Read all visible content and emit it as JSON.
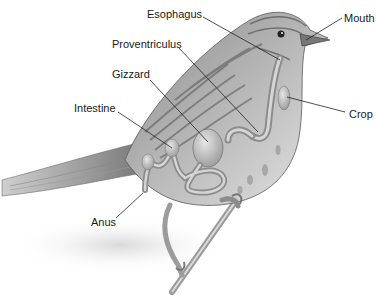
{
  "diagram": {
    "labels": [
      {
        "id": "esophagus",
        "text": "Esophagus",
        "x": 147,
        "y": 8,
        "line": [
          203,
          17,
          280,
          60
        ]
      },
      {
        "id": "mouth",
        "text": "Mouth",
        "x": 344,
        "y": 12,
        "line": [
          342,
          18,
          306,
          40
        ]
      },
      {
        "id": "proventriculus",
        "text": "Proventriculus",
        "x": 112,
        "y": 38,
        "line": [
          179,
          48,
          258,
          132
        ]
      },
      {
        "id": "gizzard",
        "text": "Gizzard",
        "x": 112,
        "y": 68,
        "line": [
          150,
          80,
          208,
          142
        ]
      },
      {
        "id": "intestine",
        "text": "Intestine",
        "x": 74,
        "y": 102,
        "line": [
          118,
          112,
          172,
          148
        ]
      },
      {
        "id": "crop",
        "text": "Crop",
        "x": 349,
        "y": 108,
        "line": [
          345,
          112,
          287,
          97
        ]
      },
      {
        "id": "anus",
        "text": "Anus",
        "x": 91,
        "y": 216,
        "line": [
          116,
          218,
          143,
          193
        ]
      }
    ],
    "colors": {
      "label_text": "#1a1a1a",
      "leader_line": "#222222",
      "background": "#ffffff"
    }
  }
}
